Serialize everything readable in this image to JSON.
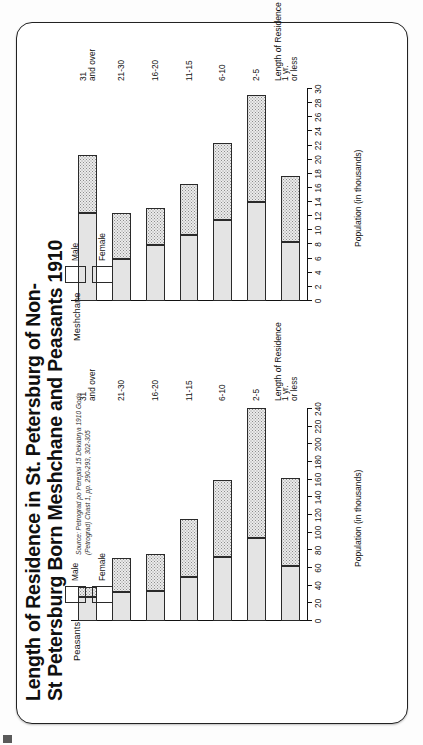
{
  "page": {
    "title_line1": "Length of Residence in St. Petersburg of Non-",
    "title_line2": "St Petersburg Born Meshchane and Peasants 1910"
  },
  "legend": {
    "male_label": "Male",
    "female_label": "Female"
  },
  "source": {
    "line1": "Source: Petrograd po Perepisi 15 Dekabrya 1910 Goda",
    "line2": "(Petrograd) Chast 1, pp. 290-293, 302-305"
  },
  "chart_data": [
    {
      "type": "bar",
      "id": "meshchane",
      "title": "Meshchane",
      "orientation": "horizontal-stacked",
      "categories": [
        "1 yr.\nor less",
        "2-5",
        "6-10",
        "11-15",
        "16-20",
        "21-30",
        "31\nand over"
      ],
      "category_labels": [
        "1 yr.",
        "or less",
        "2-5",
        "6-10",
        "11-15",
        "16-20",
        "21-30",
        "31",
        "and over"
      ],
      "xlabel": "Length of Residence",
      "ylabel": "Population (in thousands)",
      "ylim": [
        0,
        30
      ],
      "yticks": [
        0,
        2,
        4,
        6,
        8,
        10,
        12,
        14,
        16,
        18,
        20,
        22,
        24,
        26,
        28,
        30
      ],
      "ytick_labels": [
        "0",
        "2",
        "4",
        "6",
        "8",
        "10",
        "12",
        "14",
        "16",
        "18",
        "20",
        "22",
        "24",
        "26",
        "28",
        "30"
      ],
      "grid": false,
      "legend_position": "top-left",
      "series": [
        {
          "name": "Female",
          "values": [
            8.4,
            14.0,
            11.4,
            9.4,
            7.9,
            5.9,
            12.5
          ]
        },
        {
          "name": "Male",
          "values": [
            9.3,
            15.1,
            10.9,
            7.2,
            5.3,
            6.6,
            8.2
          ]
        }
      ],
      "totals": [
        17.7,
        29.1,
        22.3,
        16.6,
        13.2,
        12.5,
        20.7
      ]
    },
    {
      "type": "bar",
      "id": "peasants",
      "title": "Peasants",
      "orientation": "horizontal-stacked",
      "categories": [
        "1 yr.\nor less",
        "2-5",
        "6-10",
        "11-15",
        "16-20",
        "21-30",
        "31\nand over"
      ],
      "category_labels": [
        "1 yr.",
        "or less",
        "2-5",
        "6-10",
        "11-15",
        "16-20",
        "21-30",
        "31",
        "and over"
      ],
      "xlabel": "Length of Residence",
      "ylabel": "Population (in thousands)",
      "ylim": [
        0,
        240
      ],
      "yticks": [
        0,
        20,
        40,
        60,
        80,
        100,
        120,
        140,
        160,
        180,
        200,
        220,
        240
      ],
      "ytick_labels": [
        "0",
        "20",
        "40",
        "60",
        "80",
        "100",
        "120",
        "140",
        "160",
        "180",
        "200",
        "220",
        "240"
      ],
      "grid": false,
      "legend_position": "top-left",
      "series": [
        {
          "name": "Female",
          "values": [
            62,
            94,
            72,
            50,
            34,
            33,
            27
          ]
        },
        {
          "name": "Male",
          "values": [
            100,
            147,
            88,
            65,
            42,
            38,
            12
          ]
        }
      ],
      "totals": [
        162,
        241,
        160,
        115,
        76,
        71,
        39
      ]
    }
  ]
}
